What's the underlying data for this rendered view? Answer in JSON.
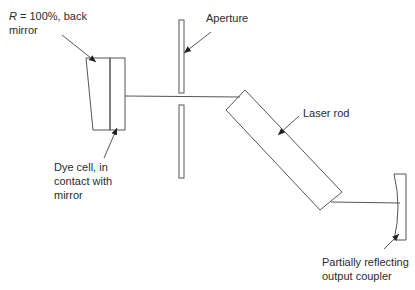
{
  "diagram": {
    "type": "dye-cell Q-switched laser resonator schematic",
    "colors": {
      "line": "#555555",
      "text": "#2b2b2b",
      "background": "#ffffff"
    },
    "labels": {
      "back_mirror": {
        "prefix_italic": "R",
        "rest": " = 100%, back",
        "line2": "mirror"
      },
      "dye_cell": {
        "line1": "Dye cell, in",
        "line2": "contact with",
        "line3": "mirror"
      },
      "aperture": "Aperture",
      "laser_rod": "Laser rod",
      "output_coupler": {
        "line1": "Partially reflecting",
        "line2": "output coupler"
      }
    },
    "components": [
      {
        "name": "back-mirror",
        "kind": "mirror",
        "reflectivity": "100%"
      },
      {
        "name": "dye-cell",
        "kind": "cell"
      },
      {
        "name": "aperture",
        "kind": "slit"
      },
      {
        "name": "laser-rod",
        "kind": "rod"
      },
      {
        "name": "output-coupler",
        "kind": "partially reflecting mirror"
      }
    ]
  }
}
